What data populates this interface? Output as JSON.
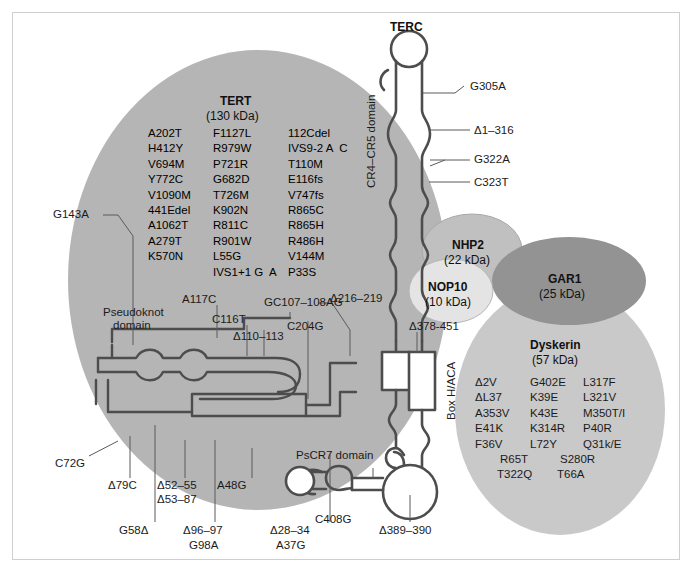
{
  "figure": {
    "title_terc": "TERC",
    "domains": {
      "cr4_cr5": "CR4–CR5 domain",
      "pseudoknot": "Pseudoknot\ndomain",
      "pseudoknot_l1": "Pseudoknot",
      "pseudoknot_l2": "domain",
      "box_hacal": "Box H/ACA",
      "pscr7": "PsCR7 domain"
    }
  },
  "proteins": {
    "tert": {
      "name": "TERT",
      "mass": "(130 kDa)"
    },
    "nhp2": {
      "name": "NHP2",
      "mass": "(22 kDa)"
    },
    "nop10": {
      "name": "NOP10",
      "mass": "(10 kDa)"
    },
    "gar1": {
      "name": "GAR1",
      "mass": "(25 kDa)"
    },
    "dyskerin": {
      "name": "Dyskerin",
      "mass": "(57 kDa)"
    }
  },
  "tert_mutations": {
    "col1": [
      "A202T",
      "H412Y",
      "V694M",
      "Y772C",
      "V1090M",
      "441Edel",
      "A1062T",
      "A279T",
      "K570N"
    ],
    "col1_style": [
      "gray",
      "gray",
      "gray",
      "gray",
      "gray",
      "gray",
      "gray",
      "gray",
      "gray"
    ],
    "col2": [
      "F1127L",
      "R979W",
      "P721R",
      "G682D",
      "T726M",
      "K902N",
      "R811C",
      "R901W",
      "L55G",
      "IVS1+1 G  A"
    ],
    "col2_style": [
      "dark",
      "dark",
      "dark",
      "dark",
      "gray",
      "bold",
      "dark",
      "dark",
      "dark",
      "dark"
    ],
    "col3": [
      "112Cdel",
      "IVS9-2 A  C",
      "T110M",
      "E116fs",
      "V747fs",
      "R865C",
      "R865H",
      "R486H",
      "V144M",
      "P33S"
    ],
    "col3_style": [
      "dark",
      "dark",
      "dark",
      "dark",
      "dark",
      "dark",
      "dark",
      "dark",
      "dark",
      "dark"
    ]
  },
  "dyskerin_mutations": {
    "col1": [
      "Δ2V",
      "ΔL37",
      "A353V",
      "E41K",
      "F36V"
    ],
    "col2": [
      "G402E",
      "K39E",
      "K43E",
      "K314R",
      "L72Y"
    ],
    "col3": [
      "L317F",
      "L321V",
      "M350T/I",
      "P40R",
      "Q31k/E"
    ],
    "row_extra1": [
      "R65T",
      "S280R"
    ],
    "row_extra2": [
      "T322Q",
      "T66A"
    ]
  },
  "terc_annotations": {
    "right": [
      "G305A",
      "Δ1–316",
      "G322A",
      "C323T",
      "Δ378-451"
    ],
    "left_top": [
      "G143A"
    ],
    "mid": [
      "A117C",
      "C116T",
      "Δ110–113",
      "GC107–108AG",
      "C204G",
      "Δ216–219"
    ],
    "bottom_upper": [
      "C72G",
      "Δ79C",
      "Δ52–55",
      "Δ53–87",
      "A48G",
      "C408G"
    ],
    "bottom_lower": [
      "G58Δ",
      "Δ96–97",
      "G98A",
      "Δ28–34",
      "A37G",
      "Δ389–390"
    ]
  },
  "colors": {
    "tert_blob": "#b5b5b5",
    "dyskerin_blob": "#c9c9c9",
    "gar1_blob": "#939393",
    "nhp2_blob": "#c0c0c0",
    "nop10_blob": "#e2e2e2",
    "rna_stroke": "#4d4d4d",
    "border": "#cfcfcf",
    "text": "#1b1b1b"
  }
}
